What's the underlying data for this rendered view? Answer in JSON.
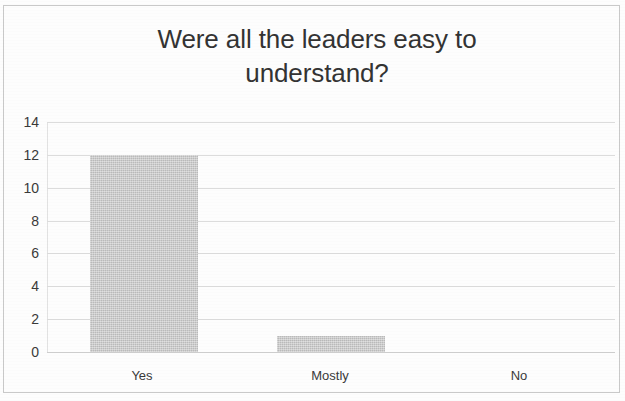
{
  "chart_data": {
    "type": "bar",
    "title": "Were all the leaders easy to\nunderstand?",
    "title_line1": "Were all the leaders easy to",
    "title_line2": "understand?",
    "categories": [
      "Yes",
      "Mostly",
      "No"
    ],
    "values": [
      12,
      1,
      0
    ],
    "series": [
      {
        "name": "Responses",
        "values": [
          12,
          1,
          0
        ]
      }
    ],
    "xlabel": "",
    "ylabel": "",
    "ylim": [
      0,
      14
    ],
    "y_ticks": [
      0,
      2,
      4,
      6,
      8,
      10,
      12,
      14
    ],
    "y_tick_labels": [
      "0",
      "2",
      "4",
      "6",
      "8",
      "10",
      "12",
      "14"
    ],
    "grid": true,
    "grid_axis": "y",
    "legend": false,
    "legend_position": "none",
    "bar_color": "#c4c4c4",
    "text_color": "#333333",
    "gridline_color": "#dcdcdc",
    "background_color": "#fdfdfd",
    "border_color": "#c9c9c9"
  }
}
